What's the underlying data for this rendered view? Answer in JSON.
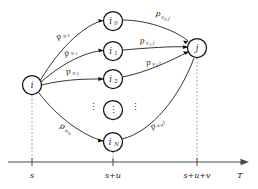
{
  "figure": {
    "title": "",
    "axis": {
      "name": "time-axis",
      "label": "T",
      "ticks": [
        {
          "label": "s",
          "x": 32
        },
        {
          "label": "s+u",
          "x": 113
        },
        {
          "label": "s+u+v",
          "x": 197
        }
      ]
    },
    "nodes": [
      {
        "id": "i",
        "label": "i",
        "sub": "",
        "x": 32,
        "y": 85,
        "r": 9.5
      },
      {
        "id": "i0",
        "label": "i",
        "sub": "0",
        "x": 113,
        "y": 21,
        "r": 9.5
      },
      {
        "id": "i1",
        "label": "i",
        "sub": "1",
        "x": 113,
        "y": 51,
        "r": 9.5
      },
      {
        "id": "i2",
        "label": "i",
        "sub": "2",
        "x": 113,
        "y": 79,
        "r": 9.5
      },
      {
        "id": "idots",
        "label": "⋮",
        "sub": "",
        "x": 113,
        "y": 110,
        "r": 9.5
      },
      {
        "id": "iN",
        "label": "i",
        "sub": "N",
        "x": 113,
        "y": 142,
        "r": 9.5
      },
      {
        "id": "j",
        "label": "j",
        "sub": "",
        "x": 197,
        "y": 48,
        "r": 9.5
      }
    ],
    "edge_labels_left": [
      {
        "base": "p",
        "sub": "u",
        "sub2": "0",
        "x": 62,
        "y": 35
      },
      {
        "base": "p",
        "sub": "u",
        "sub2": "1",
        "x": 70,
        "y": 52
      },
      {
        "base": "p",
        "sub": "u",
        "sub2": "2",
        "x": 72,
        "y": 71
      },
      {
        "base": "p",
        "sub": "u",
        "sub2": "N",
        "x": 66,
        "y": 128
      }
    ],
    "edge_labels_right": [
      {
        "base": "p",
        "sub": "v",
        "sub2": "0",
        "sub3": "j",
        "x": 163,
        "y": 15
      },
      {
        "base": "p",
        "sub": "v",
        "sub2": "1",
        "sub3": "j",
        "x": 147,
        "y": 41
      },
      {
        "base": "p",
        "sub": "v",
        "sub2": "2",
        "sub3": "j",
        "x": 153,
        "y": 62
      },
      {
        "base": "p",
        "sub": "v",
        "sub2": "N",
        "sub3": "j",
        "x": 157,
        "y": 124
      }
    ],
    "ellipsis_marks": [
      {
        "name": "left-vertical-dots",
        "x": 93,
        "y": 107
      },
      {
        "name": "right-vertical-dots",
        "x": 135,
        "y": 107
      }
    ],
    "colors": {
      "stroke": "#111111",
      "axis": "#4a4a4a",
      "dashed": "#8a8a8a",
      "background": "#ffffff"
    }
  }
}
